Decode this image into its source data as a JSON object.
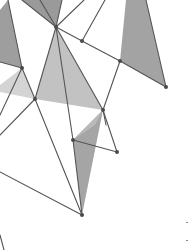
{
  "artwork": {
    "type": "low-poly geometric network illustration",
    "background": "#ffffff",
    "line_color": "#555555",
    "node_color": "#4a4a4a",
    "fills": {
      "dark": "#9a9a9a",
      "mid": "#b4b4b4",
      "light": "#cfcfcf"
    },
    "nodes": [
      {
        "id": "A",
        "x": 56,
        "y": 27
      },
      {
        "id": "B",
        "x": 82,
        "y": 41
      },
      {
        "id": "C",
        "x": 120,
        "y": 61
      },
      {
        "id": "D",
        "x": 166,
        "y": 87
      },
      {
        "id": "E",
        "x": 22,
        "y": 68
      },
      {
        "id": "F",
        "x": 35,
        "y": 99
      },
      {
        "id": "G",
        "x": 103,
        "y": 110
      },
      {
        "id": "H",
        "x": 73,
        "y": 140
      },
      {
        "id": "I",
        "x": 117,
        "y": 152
      },
      {
        "id": "J",
        "x": 82,
        "y": 215
      }
    ]
  }
}
